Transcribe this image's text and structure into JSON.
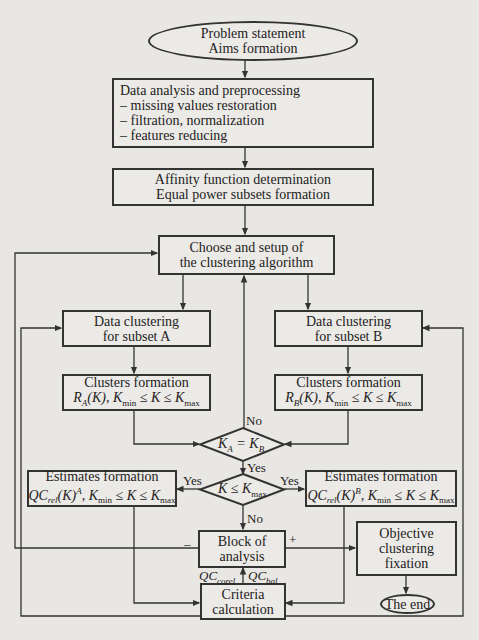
{
  "nodes": {
    "start": {
      "line1": "Problem statement",
      "line2": "Aims formation"
    },
    "preprocessing": {
      "title": "Data analysis and preprocessing",
      "items": [
        "– missing values restoration",
        "– filtration, normalization",
        "– features reducing"
      ]
    },
    "affinity": {
      "line1": "Affinity function determination",
      "line2": "Equal power subsets formation"
    },
    "choose": {
      "line1": "Choose and setup of",
      "line2": "the clustering algorithm"
    },
    "clustering_a": {
      "line1": "Data clustering",
      "line2": "for subset A"
    },
    "clustering_b": {
      "line1": "Data clustering",
      "line2": "for subset B"
    },
    "clusters_a": {
      "title": "Clusters formation",
      "formula_R": "R",
      "formula_sub": "A",
      "formula_rest": "(K), K",
      "kmin": "min",
      "rel": " ≤ K ≤ K",
      "kmax": "max"
    },
    "clusters_b": {
      "title": "Clusters formation",
      "formula_R": "R",
      "formula_sub": "B",
      "formula_rest": "(K), K",
      "kmin": "min",
      "rel": " ≤ K ≤ K",
      "kmax": "max"
    },
    "decision_eq": {
      "lhs": "K",
      "lhs_sub": "A",
      "op": " = K",
      "rhs_sub": "B"
    },
    "decision_le": {
      "lhs": "K ≤ K",
      "sub": "max"
    },
    "estimates_a": {
      "title": "Estimates formation",
      "qc": "QC",
      "rel_sub": "rel",
      "k": "(K)",
      "sup": "A",
      "rest": ", K",
      "kmin": "min",
      "rel": " ≤ K ≤ K",
      "kmax": "max"
    },
    "estimates_b": {
      "title": "Estimates formation",
      "qc": "QC",
      "rel_sub": "rel",
      "k": "(K)",
      "sup": "B",
      "rest": ", K",
      "kmin": "min",
      "rel": " ≤ K ≤ K",
      "kmax": "max"
    },
    "analysis": {
      "line1": "Block of",
      "line2": "analysis"
    },
    "criteria": {
      "line1": "Criteria",
      "line2": "calculation"
    },
    "objective": {
      "line1": "Objective",
      "line2": "clustering",
      "line3": "fixation"
    },
    "end": {
      "label": "The end"
    }
  },
  "edge_labels": {
    "no_top": "No",
    "yes_mid": "Yes",
    "yes_left": "Yes",
    "yes_right": "Yes",
    "no_bottom": "No",
    "minus": "–",
    "plus": "+",
    "qc_corel": "QC",
    "qc_corel_sub": "corel",
    "qc_bal": "QC",
    "qc_bal_sub": "bal"
  },
  "colors": {
    "line": "#333333",
    "background": "#e9e7e4"
  }
}
